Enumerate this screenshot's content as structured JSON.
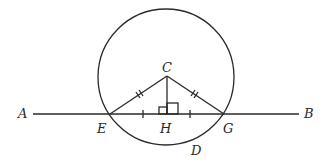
{
  "diagram": {
    "colors": {
      "stroke": "#2a2a2a",
      "background": "#ffffff"
    },
    "circle": {
      "cx": 166,
      "cy": 77,
      "r": 68
    },
    "line_AB": {
      "x1": 33,
      "y1": 114,
      "x2": 299,
      "y2": 114
    },
    "points": {
      "A": {
        "x": 33,
        "y": 114
      },
      "B": {
        "x": 299,
        "y": 114
      },
      "C": {
        "x": 167,
        "y": 76
      },
      "E": {
        "x": 110,
        "y": 114
      },
      "G": {
        "x": 224,
        "y": 114
      },
      "H": {
        "x": 167,
        "y": 114
      },
      "D": {
        "x": 190,
        "y": 143
      }
    },
    "labels": {
      "A": "A",
      "B": "B",
      "C": "C",
      "D": "D",
      "E": "E",
      "G": "G",
      "H": "H"
    },
    "marks": {
      "CE_CG_equal": "double-tick",
      "EH_HG_equal": "single-tick",
      "right_angle_at_H": true
    }
  }
}
